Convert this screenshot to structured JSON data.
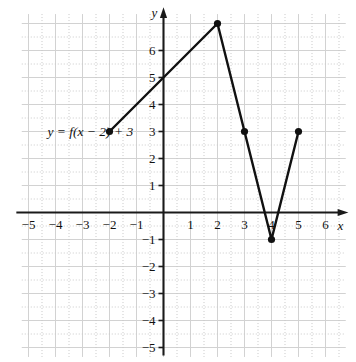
{
  "chart_data": {
    "type": "line",
    "title": "",
    "xlabel": "x",
    "ylabel": "y",
    "xlim": [
      -5.7,
      6.8
    ],
    "ylim": [
      -5.4,
      7.6
    ],
    "grid": true,
    "legend": "none",
    "annotations": [
      {
        "text": "y = f(x − 2) + 3",
        "x": -4.3,
        "y": 2.85
      }
    ],
    "series": [
      {
        "name": "y = f(x - 2) + 3",
        "x": [
          -2,
          2,
          3,
          4,
          5
        ],
        "y": [
          3,
          7,
          3,
          -1,
          3
        ],
        "markers": [
          {
            "x": -2,
            "y": 3
          },
          {
            "x": 2,
            "y": 7
          },
          {
            "x": 3,
            "y": 3
          },
          {
            "x": 4,
            "y": -1
          },
          {
            "x": 5,
            "y": 3
          }
        ]
      }
    ],
    "xticks": [
      {
        "value": -5,
        "label": "−5"
      },
      {
        "value": -4,
        "label": "−4"
      },
      {
        "value": -3,
        "label": "−3"
      },
      {
        "value": -2,
        "label": "−2"
      },
      {
        "value": -1,
        "label": "−1"
      },
      {
        "value": 1,
        "label": "1"
      },
      {
        "value": 2,
        "label": "2"
      },
      {
        "value": 3,
        "label": "3"
      },
      {
        "value": 4,
        "label": "4"
      },
      {
        "value": 5,
        "label": "5"
      },
      {
        "value": 6,
        "label": "6"
      }
    ],
    "yticks": [
      {
        "value": 6,
        "label": "6"
      },
      {
        "value": 5,
        "label": "5"
      },
      {
        "value": 4,
        "label": "4"
      },
      {
        "value": 3,
        "label": "3"
      },
      {
        "value": 2,
        "label": "2"
      },
      {
        "value": 1,
        "label": "1"
      },
      {
        "value": -1,
        "label": "−1"
      },
      {
        "value": -2,
        "label": "−2"
      },
      {
        "value": -3,
        "label": "−3"
      },
      {
        "value": -4,
        "label": "−4"
      },
      {
        "value": -5,
        "label": "−5"
      }
    ],
    "colors": {
      "curve": "#111111",
      "axis": "#1a1a1a",
      "grid_solid": "#d2d2d2",
      "grid_dotted": "#c9c9c9",
      "background": "#ffffff",
      "text": "#111111"
    }
  }
}
